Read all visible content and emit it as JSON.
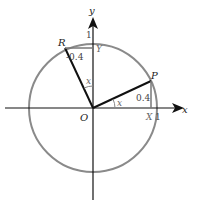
{
  "diagram": {
    "type": "unit-circle",
    "colors": {
      "circle": "#8a8a8a",
      "axes": "#111111",
      "radius": "#111111",
      "projection": "#777777",
      "text": "#222222"
    },
    "axes": {
      "x_label": "x",
      "y_label": "y"
    },
    "points": {
      "origin": "O",
      "p": "P",
      "r": "R",
      "x_foot": "X",
      "y_foot": "Y"
    },
    "tick_labels": {
      "x_one": "1",
      "y_one": "1"
    },
    "values": {
      "p_height": "0.4",
      "r_offset": "-0.4"
    },
    "angles": {
      "angle_at_x_axis": "x",
      "angle_at_y_axis": "x"
    }
  }
}
